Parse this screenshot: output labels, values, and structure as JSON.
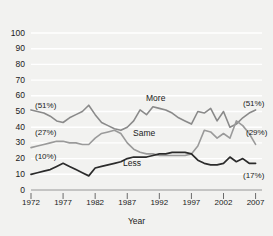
{
  "chart_data": {
    "type": "line",
    "title": "",
    "ylabel": "Percentage",
    "xlabel": "Year",
    "ylim": [
      0,
      100
    ],
    "xlim": [
      1972,
      2008
    ],
    "grid": true,
    "legend_position": "inline-labels",
    "yticks": [
      "0",
      "10",
      "20",
      "30",
      "40",
      "50",
      "60",
      "70",
      "80",
      "90",
      "100"
    ],
    "xticks": [
      "1972",
      "1977",
      "1982",
      "1987",
      "1992",
      "1997",
      "2002",
      "2007"
    ],
    "x": [
      1972,
      1973,
      1974,
      1975,
      1976,
      1977,
      1978,
      1979,
      1980,
      1981,
      1982,
      1983,
      1984,
      1985,
      1986,
      1987,
      1988,
      1989,
      1990,
      1991,
      1992,
      1993,
      1994,
      1995,
      1996,
      1997,
      1998,
      1999,
      2000,
      2001,
      2002,
      2003,
      2004,
      2005,
      2006,
      2007
    ],
    "series": [
      {
        "name": "More",
        "color": "#8a8a8a",
        "start_label": "(51%)",
        "end_label": "(51%)",
        "values": [
          51,
          50,
          49,
          47,
          44,
          43,
          46,
          48,
          50,
          54,
          48,
          43,
          41,
          39,
          38,
          40,
          44,
          51,
          48,
          53,
          52,
          51,
          49,
          46,
          44,
          42,
          50,
          49,
          52,
          44,
          50,
          40,
          42,
          46,
          49,
          51
        ]
      },
      {
        "name": "Same",
        "color": "#9a9a9a",
        "start_label": "(27%)",
        "end_label": "(29%)",
        "values": [
          27,
          28,
          29,
          30,
          31,
          31,
          30,
          30,
          29,
          29,
          33,
          36,
          37,
          38,
          36,
          30,
          26,
          24,
          23,
          23,
          22,
          22,
          22,
          22,
          22,
          23,
          28,
          38,
          37,
          33,
          36,
          33,
          44,
          41,
          36,
          29
        ]
      },
      {
        "name": "Less",
        "color": "#2b2b2b",
        "start_label": "(10%)",
        "end_label": "(17%)",
        "values": [
          10,
          11,
          12,
          13,
          15,
          17,
          15,
          13,
          11,
          9,
          14,
          15,
          16,
          17,
          18,
          20,
          21,
          21,
          21,
          22,
          23,
          23,
          24,
          24,
          24,
          23,
          19,
          17,
          16,
          16,
          17,
          21,
          18,
          20,
          17,
          17
        ]
      }
    ]
  },
  "axis_titles": {
    "y": "Percentage",
    "x": "Year"
  }
}
